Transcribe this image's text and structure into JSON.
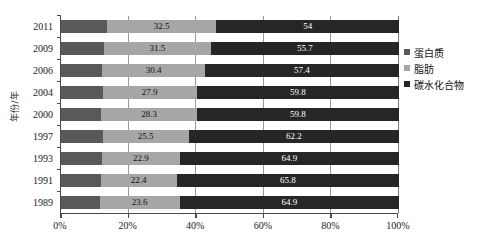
{
  "chart_data": {
    "type": "bar",
    "orientation": "horizontal",
    "stacked": true,
    "normalized": true,
    "title": "",
    "xlabel": "",
    "ylabel": "年份/年",
    "xlim": [
      0,
      100
    ],
    "xticks": [
      "0%",
      "20%",
      "40%",
      "60%",
      "80%",
      "100%"
    ],
    "xtick_values": [
      0,
      20,
      40,
      60,
      80,
      100
    ],
    "grid": true,
    "legend_position": "right",
    "categories": [
      "2011",
      "2009",
      "2006",
      "2004",
      "2000",
      "1997",
      "1993",
      "1991",
      "1989"
    ],
    "series": [
      {
        "name": "蛋白质",
        "color": "#595959",
        "values": [
          13.5,
          12.8,
          12.2,
          12.3,
          11.9,
          12.3,
          12.2,
          11.8,
          11.5
        ],
        "labels_shown": false
      },
      {
        "name": "脂肪",
        "color": "#a6a6a6",
        "values": [
          32.5,
          31.5,
          30.4,
          27.9,
          28.3,
          25.5,
          22.9,
          22.4,
          23.6
        ],
        "labels_shown": true
      },
      {
        "name": "碳水化合物",
        "color": "#262626",
        "values": [
          54,
          55.7,
          57.4,
          59.8,
          59.8,
          62.2,
          64.9,
          65.8,
          64.9
        ],
        "labels_shown": true
      }
    ]
  },
  "legend": {
    "items": [
      {
        "label": "蛋白质",
        "color": "#595959"
      },
      {
        "label": "脂肪",
        "color": "#a6a6a6"
      },
      {
        "label": "碳水化合物",
        "color": "#262626"
      }
    ]
  }
}
